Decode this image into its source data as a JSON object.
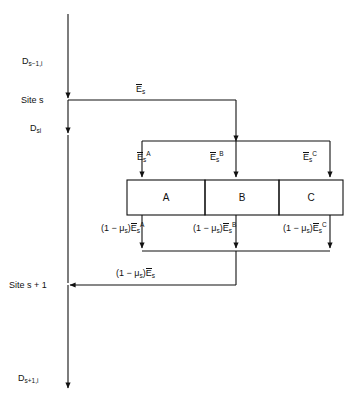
{
  "diagram": {
    "axis": {
      "name": "vertical-time-axis",
      "segments": [
        {
          "id": "d-prev",
          "label_base": "D",
          "label_sub": "s−1,i"
        },
        {
          "id": "d-current",
          "label_base": "D",
          "label_sub": "si"
        },
        {
          "id": "d-next",
          "label_base": "D",
          "label_sub": "s+1,i"
        }
      ],
      "sites": [
        {
          "id": "site-s",
          "label": "Site s"
        },
        {
          "id": "site-s-plus-1",
          "label": "Site s + 1"
        }
      ]
    },
    "inflow": {
      "name": "site-energy-inflow",
      "base": "E",
      "sub": "s",
      "sup": ""
    },
    "branch_inputs": [
      {
        "id": "input-a",
        "base": "E",
        "sub": "s",
        "sup": "A"
      },
      {
        "id": "input-b",
        "base": "E",
        "sub": "s",
        "sup": "B"
      },
      {
        "id": "input-c",
        "base": "E",
        "sub": "s",
        "sup": "C"
      }
    ],
    "boxes": [
      {
        "id": "box-a",
        "label": "A"
      },
      {
        "id": "box-b",
        "label": "B"
      },
      {
        "id": "box-c",
        "label": "C"
      }
    ],
    "branch_outputs": [
      {
        "id": "output-a",
        "prefix": "(1 − μ",
        "prefix_sub": "s",
        "prefix_close": ")",
        "base": "E",
        "sub": "s",
        "sup": "A"
      },
      {
        "id": "output-b",
        "prefix": "(1 − μ",
        "prefix_sub": "s",
        "prefix_close": ")",
        "base": "E",
        "sub": "s",
        "sup": "B"
      },
      {
        "id": "output-c",
        "prefix": "(1 − μ",
        "prefix_sub": "s",
        "prefix_close": ")",
        "base": "E",
        "sub": "s",
        "sup": "C"
      }
    ],
    "return_flow": {
      "id": "return-flow",
      "prefix": "(1 − μ",
      "prefix_sub": "s",
      "prefix_close": ")",
      "base": "E",
      "sub": "s",
      "sup": ""
    },
    "colors": {
      "line": "#111111",
      "text": "#111111",
      "background": "#ffffff"
    }
  }
}
